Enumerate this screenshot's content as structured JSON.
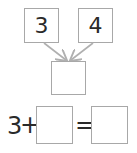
{
  "number_bond": {
    "left_part": "3",
    "right_part": "4",
    "whole": ""
  },
  "equation": {
    "addend_1": "3",
    "plus_sign": "+",
    "addend_2_blank": "",
    "equals_sign": "=",
    "sum_blank": ""
  },
  "colors": {
    "box_border": "#a8a8a8",
    "arrow": "#b0b0b0",
    "text": "#2a2a2a"
  }
}
